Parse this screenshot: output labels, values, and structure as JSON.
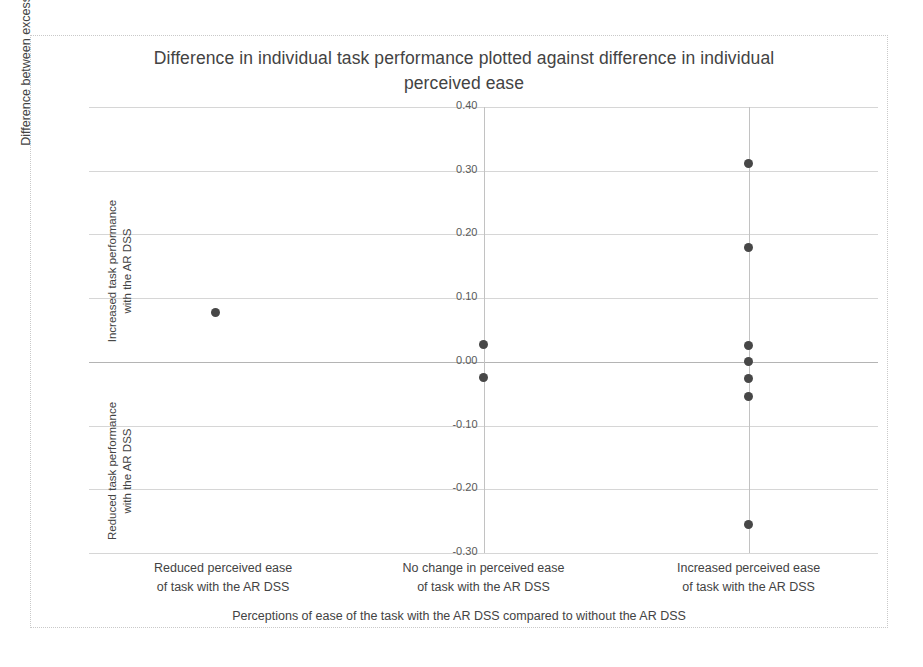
{
  "chart_data": {
    "type": "scatter",
    "title": "Difference in individual task performance plotted against difference in individual perceived ease",
    "xlabel": "Perceptions of ease of the task with the AR DSS compared to without the AR DSS",
    "ylabel": "Difference between excess cost with and without the AR DSS",
    "ylim": [
      -0.3,
      0.4
    ],
    "yticks": [
      "0.40",
      "0.30",
      "0.20",
      "0.10",
      "0.00",
      "-0.10",
      "-0.20",
      "-0.30"
    ],
    "ytick_values": [
      0.4,
      0.3,
      0.2,
      0.1,
      0.0,
      -0.1,
      -0.2,
      -0.3
    ],
    "grid": true,
    "legend": "none",
    "categories": [
      "Reduced perceived ease of task with the AR DSS",
      "No change in perceived ease of task with the AR DSS",
      "Increased perceived ease of task with the AR DSS"
    ],
    "category_labels_line1": [
      "Reduced perceived ease",
      "No change in perceived ease",
      "Increased perceived ease"
    ],
    "category_labels_line2": [
      "of task with the AR DSS",
      "of task with the AR DSS",
      "of task with the AR DSS"
    ],
    "y_annotation_upper": "Increased task performance with the AR DSS",
    "y_annotation_upper_line1": "Increased task performance",
    "y_annotation_upper_line2": "with the AR DSS",
    "y_annotation_lower": "Reduced task performance with the AR DSS",
    "y_annotation_lower_line1": "Reduced task performance",
    "y_annotation_lower_line2": "with the AR DSS",
    "marker_color": "#474747",
    "gridline_color": "#d6d6d6",
    "series": [
      {
        "name": "Individual participants",
        "points": [
          {
            "category": "Reduced perceived ease of task with the AR DSS",
            "x": 0.16,
            "y": 0.078
          },
          {
            "category": "No change in perceived ease of task with the AR DSS",
            "x": 0.5,
            "y": 0.028
          },
          {
            "category": "No change in perceived ease of task with the AR DSS",
            "x": 0.5,
            "y": -0.025
          },
          {
            "category": "Increased perceived ease of task with the AR DSS",
            "x": 0.836,
            "y": 0.311
          },
          {
            "category": "Increased perceived ease of task with the AR DSS",
            "x": 0.836,
            "y": 0.18
          },
          {
            "category": "Increased perceived ease of task with the AR DSS",
            "x": 0.836,
            "y": 0.025
          },
          {
            "category": "Increased perceived ease of task with the AR DSS",
            "x": 0.836,
            "y": 0.0
          },
          {
            "category": "Increased perceived ease of task with the AR DSS",
            "x": 0.836,
            "y": -0.026
          },
          {
            "category": "Increased perceived ease of task with the AR DSS",
            "x": 0.836,
            "y": -0.055
          },
          {
            "category": "Increased perceived ease of task with the AR DSS",
            "x": 0.836,
            "y": -0.255
          }
        ]
      }
    ],
    "category_dividers_x": [
      0.5,
      0.836
    ]
  }
}
